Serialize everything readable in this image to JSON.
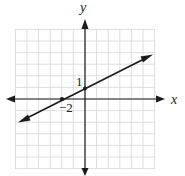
{
  "chart_data": {
    "type": "line",
    "title": "",
    "xlabel": "x",
    "ylabel": "y",
    "xlim": [
      -6,
      6
    ],
    "ylim": [
      -6,
      6
    ],
    "grid": true,
    "annotations": [
      {
        "text": "1",
        "at": [
          0,
          1
        ],
        "meaning": "y-intercept"
      },
      {
        "text": "−2",
        "at": [
          -2,
          0
        ],
        "meaning": "x-intercept"
      }
    ],
    "series": [
      {
        "name": "line",
        "equation": "y = 0.5x + 1",
        "slope": 0.5,
        "intercept": 1,
        "points": [
          [
            -2,
            0
          ],
          [
            0,
            1
          ]
        ],
        "arrows": "both ends",
        "x_range": [
          -5.7,
          5.8
        ]
      }
    ],
    "legend": null
  },
  "labels": {
    "x_axis": "x",
    "y_axis": "y",
    "y_intercept": "1",
    "x_intercept": "−2"
  },
  "colors": {
    "grid": "#d6d6d6",
    "axis": "#1a1a1a",
    "line": "#1a1a1a"
  }
}
